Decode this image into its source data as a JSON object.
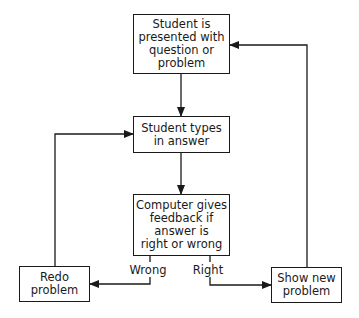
{
  "diagram": {
    "type": "flowchart",
    "nodes": {
      "present": {
        "label": "Student is\npresented with\nquestion or\nproblem"
      },
      "types": {
        "label": "Student types\nin answer"
      },
      "feedback": {
        "label": "Computer gives\nfeedback if\nanswer is\nright or wrong"
      },
      "redo": {
        "label": "Redo\nproblem"
      },
      "shownew": {
        "label": "Show new\nproblem"
      }
    },
    "edges": {
      "wrong": {
        "label": "Wrong"
      },
      "right": {
        "label": "Right"
      }
    },
    "colors": {
      "line": "#1a1a1a",
      "background": "#ffffff"
    }
  }
}
